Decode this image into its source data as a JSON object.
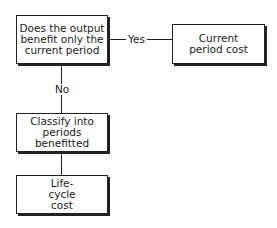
{
  "diagram": {
    "decision": {
      "text": "Does the output benefit only the current period"
    },
    "yes_label": "Yes",
    "no_label": "No",
    "current_cost": {
      "text": "Current period cost"
    },
    "classify": {
      "text": "Classify into periods benefitted"
    },
    "lifecycle": {
      "text": "Life-cycle cost"
    }
  }
}
